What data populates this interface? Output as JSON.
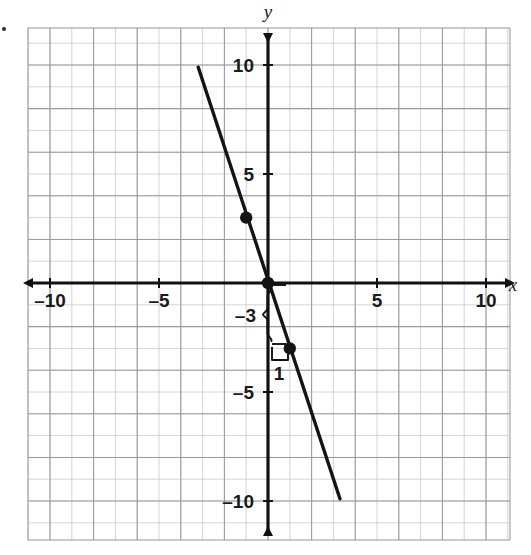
{
  "figure": {
    "title": "",
    "axis_labels": {
      "x": "x",
      "y": "y"
    },
    "x_ticks": [
      {
        "value": -10,
        "label": "–10"
      },
      {
        "value": -5,
        "label": "–5"
      },
      {
        "value": 5,
        "label": "5"
      },
      {
        "value": 10,
        "label": "10"
      }
    ],
    "y_ticks": [
      {
        "value": 10,
        "label": "10"
      },
      {
        "value": 5,
        "label": "5"
      },
      {
        "value": -5,
        "label": "–5"
      },
      {
        "value": -10,
        "label": "–10"
      }
    ],
    "annotations": [
      {
        "name": "rise-brace-label",
        "label": "–3"
      },
      {
        "name": "run-bracket-label",
        "label": "1"
      }
    ]
  },
  "chart_data": {
    "type": "line",
    "title": "",
    "xlabel": "x",
    "ylabel": "y",
    "xlim": [
      -11.0,
      11.1
    ],
    "ylim": [
      -11.7,
      11.7
    ],
    "grid": true,
    "minor_grid": true,
    "grid_step": 1,
    "major_grid_step": 2,
    "legend": "none",
    "series": [
      {
        "name": "line",
        "equation": "y = -3x",
        "slope": -3,
        "intercept": 0,
        "x": [
          -3.2,
          3.3
        ],
        "y": [
          9.9,
          -9.9
        ],
        "color": "#141414",
        "linewidth": 3
      }
    ],
    "points": [
      {
        "label": "",
        "x": -1,
        "y": 3
      },
      {
        "label": "",
        "x": 0,
        "y": 0
      },
      {
        "label": "",
        "x": 1,
        "y": -3
      }
    ],
    "annotations": [
      {
        "text": "–3",
        "type": "brace",
        "orientation": "vertical",
        "from": {
          "x": 0,
          "y": 0
        },
        "to": {
          "x": 0,
          "y": -3
        },
        "meaning": "rise"
      },
      {
        "text": "1",
        "type": "bracket",
        "orientation": "horizontal",
        "from": {
          "x": 0,
          "y": -3
        },
        "to": {
          "x": 1,
          "y": -3
        },
        "meaning": "run"
      }
    ]
  },
  "colors": {
    "grid_major": "#9a9aa0",
    "grid_minor": "#c9c9cf",
    "axis": "#111111",
    "curve": "#141414",
    "point": "#141414",
    "background": "#ffffff"
  }
}
